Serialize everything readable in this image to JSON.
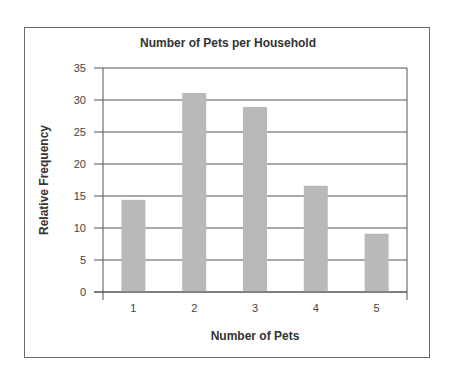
{
  "chart_data": {
    "type": "bar",
    "title": "Number of Pets per Household",
    "xlabel": "Number of Pets",
    "ylabel": "Relative Frequency",
    "categories": [
      "1",
      "2",
      "3",
      "4",
      "5"
    ],
    "values": [
      14.4,
      31.1,
      28.9,
      16.6,
      9.1
    ],
    "ylim": [
      0,
      35
    ],
    "yticks": [
      0,
      5,
      10,
      15,
      20,
      25,
      30,
      35
    ],
    "grid": true,
    "legend": null,
    "colors": {
      "bar": "#b9b9b9",
      "grid": "#555555",
      "frame": "#6a6a6a"
    }
  }
}
